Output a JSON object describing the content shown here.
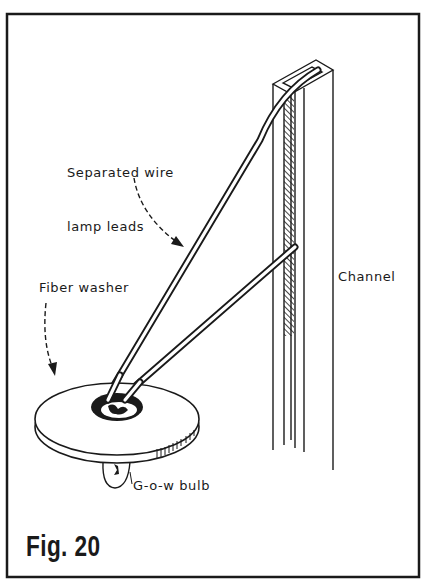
{
  "figure": {
    "caption": "Fig. 20",
    "colors": {
      "ink": "#1a1a1a",
      "paper": "#ffffff"
    }
  },
  "labels": {
    "wire_leads_line1": "Separated wire",
    "wire_leads_line2": "lamp leads",
    "fiber_washer": "Fiber washer",
    "channel": "Channel",
    "bulb": "G-o-w bulb"
  },
  "parts": [
    {
      "id": "channel",
      "name": "Channel",
      "description": "Vertical U-section channel with hatched inner face"
    },
    {
      "id": "wire-leads",
      "name": "Separated wire lamp leads",
      "description": "Two wires running from channel top and side down to washer"
    },
    {
      "id": "fiber-washer",
      "name": "Fiber washer",
      "description": "Flat disk with central hole"
    },
    {
      "id": "bulb",
      "name": "G-o-w bulb",
      "description": "Grain-of-wheat bulb under washer"
    }
  ]
}
